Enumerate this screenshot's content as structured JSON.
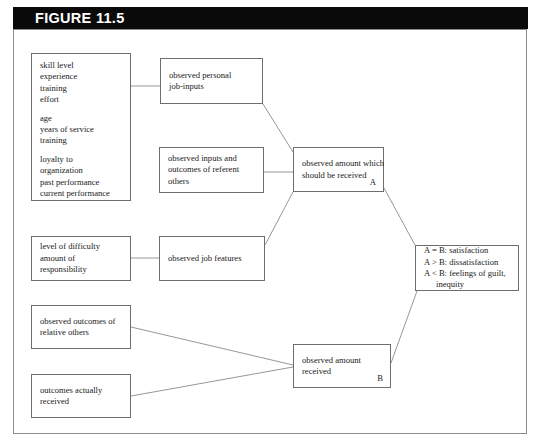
{
  "figure": {
    "title": "FIGURE 11.5",
    "title_bar_color": "#0a0a0a",
    "title_text_color": "#ffffff",
    "frame_border_color": "#8c8c8c",
    "box_border_color": "#6e6e6e",
    "line_color": "#8a8a8a",
    "background": "#ffffff"
  },
  "nodes": {
    "personal_inputs_list": {
      "group1": [
        "skill level",
        "experience",
        "training",
        "effort"
      ],
      "group2": [
        "age",
        "years of service",
        "training"
      ],
      "group3": [
        "loyalty to",
        "organization",
        "past performance",
        "current performance"
      ]
    },
    "observed_personal_job_inputs": {
      "lines": [
        "observed personal",
        "job-inputs"
      ]
    },
    "observed_inputs_outcomes_referent": {
      "lines": [
        "observed inputs and",
        "outcomes of referent",
        "others"
      ]
    },
    "observed_amount_should": {
      "lines": [
        "observed amount which",
        "should be received"
      ],
      "tag": "A"
    },
    "job_difficulty_list": {
      "lines": [
        "level of difficulty",
        "amount of",
        "responsibility"
      ]
    },
    "observed_job_features": {
      "lines": [
        "observed job features"
      ]
    },
    "comparison_outcomes": {
      "lines": [
        "A = B: satisfaction",
        "A > B: dissatisfaction",
        "A < B: feelings of guilt,"
      ],
      "indented": "inequity"
    },
    "observed_outcomes_relative_others": {
      "lines": [
        "observed outcomes of",
        "relative others"
      ]
    },
    "outcomes_actually_received": {
      "lines": [
        "outcomes actually",
        "received"
      ]
    },
    "observed_amount_received": {
      "lines": [
        "observed amount",
        "received"
      ],
      "tag": "B"
    }
  }
}
